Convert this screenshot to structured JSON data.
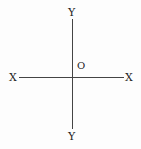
{
  "diagram": {
    "type": "coordinate-axes",
    "labels": {
      "y_top": "Y",
      "y_bottom": "Y",
      "x_left": "X",
      "x_right": "X",
      "origin": "O"
    },
    "line_color": "#444444",
    "text_color": "#222222"
  }
}
